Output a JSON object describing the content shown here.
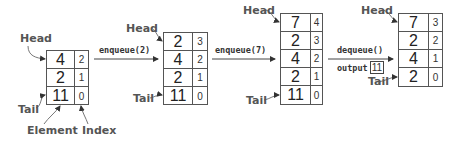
{
  "diagram": {
    "labels": {
      "head": "Head",
      "tail": "Tail",
      "element": "Element",
      "index": "Index",
      "output": "output"
    },
    "operations": [
      {
        "label": "enqueue(2)"
      },
      {
        "label": "enqueue(7)"
      },
      {
        "label": "dequeue()",
        "output_value": "11"
      }
    ],
    "stacks": [
      {
        "rows": [
          {
            "element": "4",
            "index": "2"
          },
          {
            "element": "2",
            "index": "1"
          },
          {
            "element": "11",
            "index": "0"
          }
        ]
      },
      {
        "rows": [
          {
            "element": "2",
            "index": "3"
          },
          {
            "element": "4",
            "index": "2"
          },
          {
            "element": "2",
            "index": "1"
          },
          {
            "element": "11",
            "index": "0"
          }
        ]
      },
      {
        "rows": [
          {
            "element": "7",
            "index": "4"
          },
          {
            "element": "2",
            "index": "3"
          },
          {
            "element": "4",
            "index": "2"
          },
          {
            "element": "2",
            "index": "1"
          },
          {
            "element": "11",
            "index": "0"
          }
        ]
      },
      {
        "rows": [
          {
            "element": "7",
            "index": "3"
          },
          {
            "element": "2",
            "index": "2"
          },
          {
            "element": "4",
            "index": "1"
          },
          {
            "element": "2",
            "index": "0"
          }
        ]
      }
    ]
  }
}
